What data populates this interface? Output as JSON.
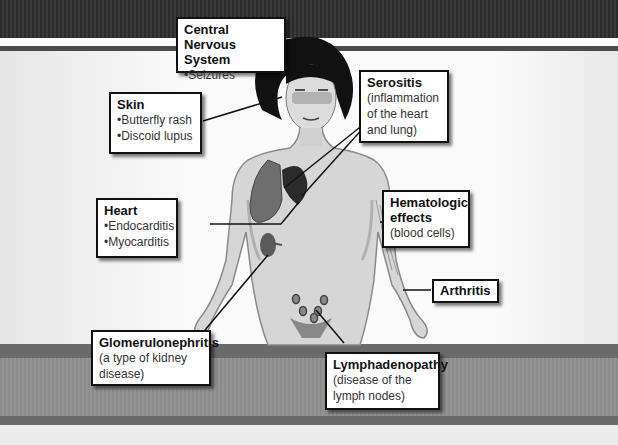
{
  "diagram": {
    "colors": {
      "box_border": "#111111",
      "box_bg": "#ffffff",
      "band_dark": "#333333",
      "band_mid": "#909090"
    },
    "labels": [
      {
        "id": "cns",
        "title": "Central Nervous System",
        "lines": [
          "•Seizures"
        ]
      },
      {
        "id": "skin",
        "title": "Skin",
        "lines": [
          "•Butterfly rash",
          "•Discoid lupus"
        ]
      },
      {
        "id": "serositis",
        "title": "Serositis",
        "lines": [
          "(inflammation",
          "of the heart",
          "and lung)"
        ]
      },
      {
        "id": "heart",
        "title": "Heart",
        "lines": [
          "•Endocarditis",
          "•Myocarditis"
        ]
      },
      {
        "id": "hematologic",
        "title": "Hematologic effects",
        "lines": [
          "(blood cells)"
        ]
      },
      {
        "id": "arthritis",
        "title": "Arthritis",
        "lines": []
      },
      {
        "id": "glomerulonephritis",
        "title": "Glomerulonephritis",
        "lines": [
          "(a type of kidney",
          "disease)"
        ]
      },
      {
        "id": "lymphadenopathy",
        "title": "Lymphadenopathy",
        "lines": [
          "(disease of the",
          "lymph nodes)"
        ]
      }
    ]
  }
}
